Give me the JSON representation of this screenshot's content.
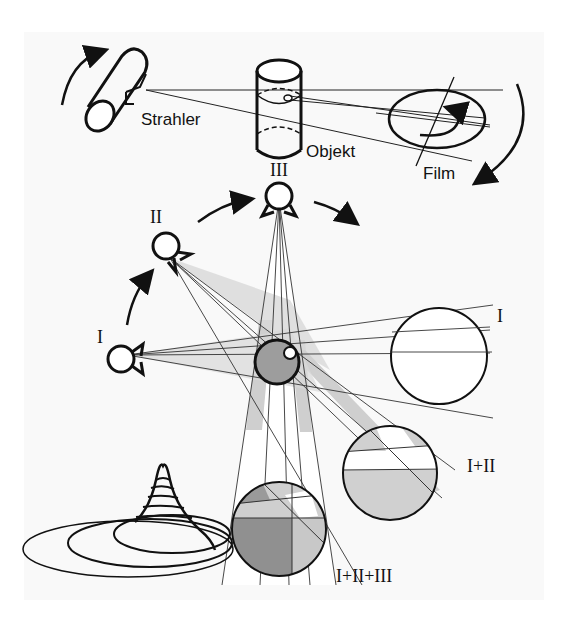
{
  "diagram": {
    "type": "ct-projection-illustration",
    "top_labels": {
      "source": "Strahler",
      "object": "Objekt",
      "film": "Film"
    },
    "positions": [
      {
        "id": "I",
        "label": "I"
      },
      {
        "id": "II",
        "label": "II"
      },
      {
        "id": "III",
        "label": "III"
      }
    ],
    "projection_labels": {
      "p1": "I",
      "p2": "I+II",
      "p3": "I+II+III"
    },
    "colors": {
      "background": "#f9f9f9",
      "stroke": "#111111",
      "shade_light": "#d6d6d6",
      "shade_mid": "#bdbdbd",
      "shade_dark": "#8f8f8f"
    }
  }
}
